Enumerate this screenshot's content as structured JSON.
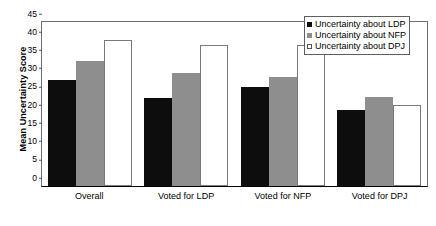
{
  "chart_data": {
    "type": "bar",
    "title": "",
    "xlabel": "",
    "ylabel": "Mean Uncertainty Score",
    "ylim": [
      0,
      45
    ],
    "yticks": [
      0,
      5,
      10,
      15,
      20,
      25,
      30,
      35,
      40,
      45
    ],
    "grid": false,
    "legend_position": "top-right",
    "categories": [
      "Overall",
      "Voted for LDP",
      "Voted for NFP",
      "Voted for DPJ"
    ],
    "series": [
      {
        "name": "Uncertainty about LDP",
        "color": "#0d0d0d",
        "values": [
          29.0,
          24.1,
          27.1,
          20.8
        ]
      },
      {
        "name": "Uncertainty about NFP",
        "color": "#8e8e8e",
        "values": [
          34.3,
          31.0,
          29.8,
          24.5
        ]
      },
      {
        "name": "Uncertainty about DPJ",
        "color": "#ffffff",
        "values": [
          40.0,
          38.8,
          38.6,
          22.3
        ]
      }
    ]
  }
}
